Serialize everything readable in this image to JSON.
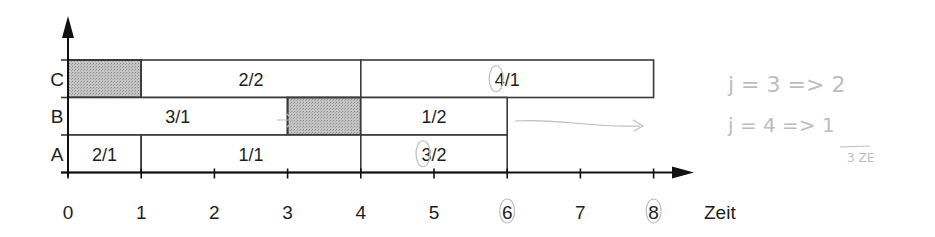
{
  "diagram": {
    "type": "gantt",
    "x_axis": {
      "title": "Zeit",
      "ticks": [
        0,
        1,
        2,
        3,
        4,
        5,
        6,
        7,
        8
      ],
      "circled_ticks": [
        6,
        8
      ]
    },
    "rows": [
      {
        "label": "C",
        "segments": [
          {
            "start": 0,
            "end": 1,
            "label": "",
            "shaded": true
          },
          {
            "start": 1,
            "end": 4,
            "label": "2/2",
            "shaded": false
          },
          {
            "start": 4,
            "end": 8,
            "label": "4/1",
            "shaded": false,
            "circled_char": "4"
          }
        ]
      },
      {
        "label": "B",
        "segments": [
          {
            "start": 0,
            "end": 3,
            "label": "3/1",
            "shaded": false
          },
          {
            "start": 3,
            "end": 4,
            "label": "",
            "shaded": true
          },
          {
            "start": 4,
            "end": 6,
            "label": "1/2",
            "shaded": false
          }
        ]
      },
      {
        "label": "A",
        "segments": [
          {
            "start": 0,
            "end": 1,
            "label": "2/1",
            "shaded": false
          },
          {
            "start": 1,
            "end": 4,
            "label": "1/1",
            "shaded": false
          },
          {
            "start": 4,
            "end": 6,
            "label": "3/2",
            "shaded": false,
            "circled_char": "3"
          }
        ]
      }
    ],
    "colors": {
      "line": "#3a3a3a",
      "shaded": "#b9b9b9",
      "text": "#1e1e1e",
      "pencil": "#bdbdbd"
    }
  },
  "annotations": {
    "handwritten_lines": [
      "j = 3  => 2",
      "j = 4  => 1"
    ],
    "handwritten_total": "3 ZE",
    "arrow_in_B_gap": "→",
    "arrow_after_B": "→"
  }
}
